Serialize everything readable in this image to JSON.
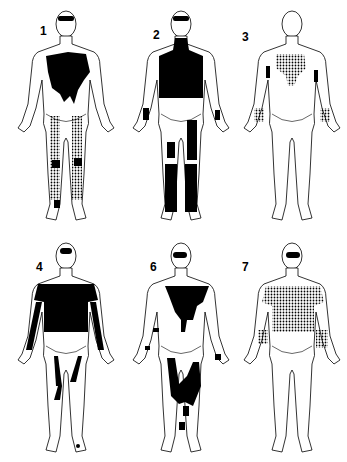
{
  "figures": [
    {
      "label": "1",
      "pattern": "solid chest blob + stippled legs"
    },
    {
      "label": "2",
      "pattern": "solid torso/neck + solid leg patches"
    },
    {
      "label": "3",
      "pattern": "stippled chest + stippled forearms"
    },
    {
      "label": "4",
      "pattern": "solid torso + solid arm/leg stripes"
    },
    {
      "label": "6",
      "pattern": "solid chest + solid thigh patches"
    },
    {
      "label": "7",
      "pattern": "stippled torso + stippled forearms"
    }
  ],
  "colors": {
    "ink": "#000000",
    "paper": "#ffffff"
  }
}
